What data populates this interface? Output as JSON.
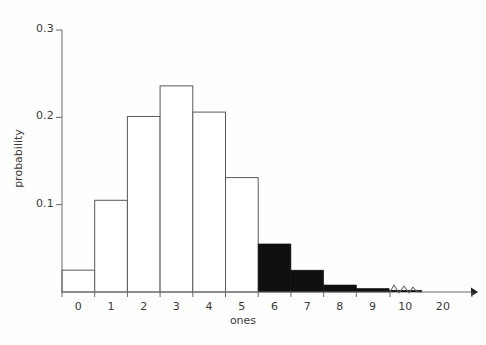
{
  "chart_data": {
    "type": "bar",
    "title": "",
    "xlabel": "ones",
    "ylabel": "probability",
    "categories": [
      "0",
      "1",
      "2",
      "3",
      "4",
      "5",
      "6",
      "7",
      "8",
      "9",
      "10",
      "20"
    ],
    "values": [
      0.025,
      0.105,
      0.201,
      0.236,
      0.206,
      0.131,
      0.055,
      0.025,
      0.008,
      0.004,
      0.002,
      0.0
    ],
    "bar_fill": [
      "white",
      "white",
      "white",
      "white",
      "white",
      "white",
      "black",
      "black",
      "black",
      "black",
      "black",
      "black"
    ],
    "highlight_from_category": "6",
    "ylim": [
      0,
      0.3
    ],
    "yticks": [
      0.1,
      0.2,
      0.3
    ],
    "ytick_labels": [
      "0.1",
      "0.2",
      "0.3"
    ],
    "xtick_labels": [
      "0",
      "1",
      "2",
      "3",
      "4",
      "5",
      "6",
      "7",
      "8",
      "9",
      "10",
      "20"
    ],
    "grid": false,
    "legend": null,
    "axis_break": {
      "present": true,
      "style": "zigzag",
      "between": [
        "10",
        "20"
      ]
    },
    "axis_arrow": true,
    "colors": {
      "outline": "#5a5a5a",
      "fill_highlight": "#101010",
      "fill_plain": "#ffffff",
      "axis": "#6a6a6a",
      "text": "#3a3a3a",
      "background": "#fefefe"
    }
  },
  "axis": {
    "y_title": "probability",
    "x_title": "ones"
  }
}
